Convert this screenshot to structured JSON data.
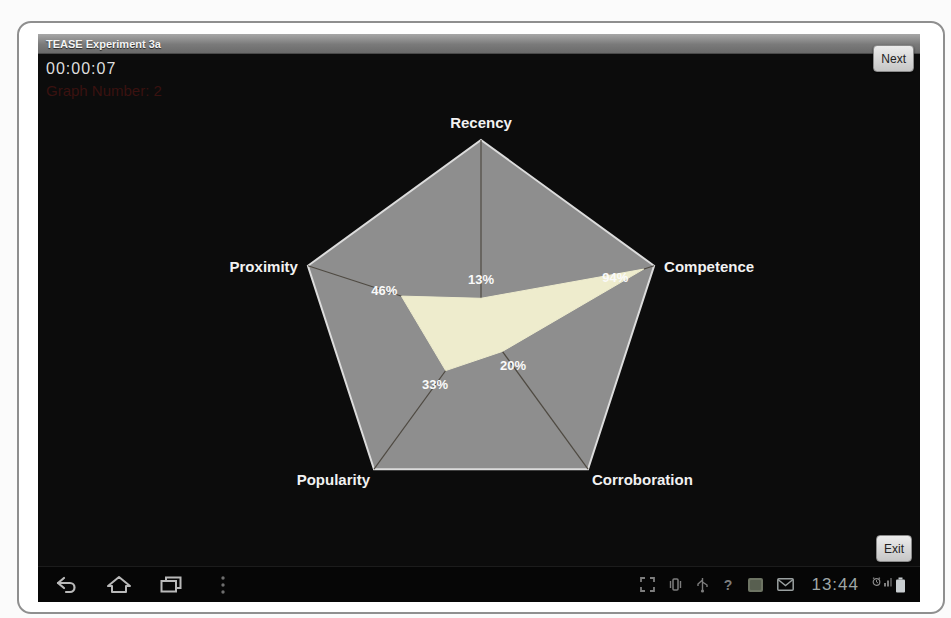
{
  "window": {
    "title": "TEASE Experiment 3a"
  },
  "hud": {
    "timer": "00:00:07",
    "graph_number": "Graph Number: 2"
  },
  "buttons": {
    "next": "Next",
    "exit": "Exit"
  },
  "chart_data": {
    "type": "radar",
    "title": "",
    "categories": [
      "Recency",
      "Competence",
      "Corroboration",
      "Popularity",
      "Proximity"
    ],
    "values": [
      13,
      94,
      20,
      33,
      46
    ],
    "value_labels": [
      "13%",
      "94%",
      "20%",
      "33%",
      "46%"
    ],
    "max": 100,
    "grid": "single-outer-pentagon-with-spokes",
    "colors": {
      "pentagon_fill": "#8e8e8e",
      "pentagon_border": "#dcdcdc",
      "spoke": "#4f4a42",
      "data_fill": "#eeeccd",
      "axis_label": "#f2f2f2",
      "value_label": "#fafafa",
      "background": "#0c0c0c"
    }
  },
  "navbar": {
    "left_icons": [
      "back-icon",
      "home-icon",
      "recents-icon",
      "menu-overflow-icon"
    ],
    "status_icons": [
      "screenshot-icon",
      "vibrate-icon",
      "usb-icon",
      "help-icon",
      "app-icon",
      "email-icon"
    ],
    "clock": "13:44",
    "right_icons": [
      "alarm-icon",
      "signal-icon",
      "battery-icon"
    ]
  }
}
